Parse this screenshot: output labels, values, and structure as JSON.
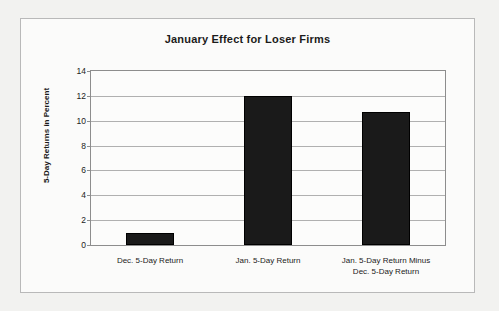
{
  "chart_data": {
    "type": "bar",
    "title": "January Effect for Loser Firms",
    "xlabel": "",
    "ylabel": "5-Day Returns in Percent",
    "categories": [
      "Dec. 5-Day Return",
      "Jan. 5-Day Return",
      "Jan. 5-Day Return Minus\nDec. 5-Day Return"
    ],
    "category_lines": [
      [
        "Dec. 5-Day Return"
      ],
      [
        "Jan. 5-Day Return"
      ],
      [
        "Jan. 5-Day Return Minus",
        "Dec. 5-Day Return"
      ]
    ],
    "values": [
      1.0,
      12.0,
      10.7
    ],
    "ylim": [
      0,
      14
    ],
    "ytick_step": 2,
    "yticks": [
      0,
      2,
      4,
      6,
      8,
      10,
      12,
      14
    ],
    "ytick_labels": [
      "0",
      "2",
      "4",
      "6",
      "8",
      "10",
      "12",
      "14"
    ],
    "grid": true,
    "legend": false,
    "bar_color": "#1a1a1a",
    "plot_background": "#fcfcfb",
    "frame_background": "#fbfbfa",
    "page_background": "#f2f2f0",
    "axis_color": "#8d8d8d",
    "grid_color": "#b0b0b0",
    "text_color": "#1b1b1b"
  }
}
